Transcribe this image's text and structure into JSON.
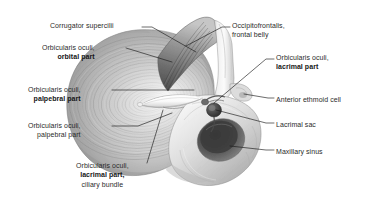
{
  "figure": {
    "kind": "anatomical-illustration",
    "view": "right anterolateral oblique",
    "style": "grayscale halftone medical illustration",
    "background_color": "#ffffff",
    "text_color": "#2b2b2b",
    "leader_color": "#1c1c1c"
  },
  "labels": [
    {
      "id": "corrugator-supercilii",
      "side": "left",
      "align": "right",
      "lines": [
        {
          "text": "Corrugator supercilii",
          "bold": false
        }
      ],
      "x": 36,
      "y": 21,
      "leader": [
        [
          142,
          27
        ],
        [
          152,
          27
        ],
        [
          196,
          52
        ]
      ]
    },
    {
      "id": "orbicularis-oculi-orbital-part",
      "side": "left",
      "align": "right",
      "lines": [
        {
          "text": "Orbicularis oculi,",
          "bold": false
        },
        {
          "text": "orbital part",
          "bold": true
        }
      ],
      "x": 28,
      "y": 43,
      "leader": [
        [
          126,
          48
        ],
        [
          172,
          62
        ]
      ]
    },
    {
      "id": "orbicularis-oculi-palpebral-part-upper",
      "side": "left",
      "align": "right",
      "lines": [
        {
          "text": "Orbicularis oculi,",
          "bold": false
        },
        {
          "text": "palpebral part",
          "bold": true
        }
      ],
      "x": 14,
      "y": 85,
      "leader": [
        [
          112,
          90
        ],
        [
          194,
          90
        ]
      ]
    },
    {
      "id": "orbicularis-oculi-palpebral-part-lower",
      "side": "left",
      "align": "right",
      "lines": [
        {
          "text": "Orbicularis oculi,",
          "bold": false
        },
        {
          "text": "palpebral part",
          "bold": false
        }
      ],
      "x": 14,
      "y": 121,
      "leader": [
        [
          112,
          126
        ],
        [
          138,
          126
        ],
        [
          172,
          113
        ]
      ]
    },
    {
      "id": "orbicularis-oculi-lacrimal-part-ciliary-bundle",
      "side": "bottom",
      "align": "center",
      "lines": [
        {
          "text": "Orbicularis oculi,",
          "bold": false
        },
        {
          "text": "lacrimal part,",
          "bold": true
        },
        {
          "text": "ciliary bundle",
          "bold": false
        }
      ],
      "x": 76,
      "y": 161,
      "leader": [
        [
          147,
          163
        ],
        [
          163,
          110
        ]
      ]
    },
    {
      "id": "occipitofrontalis-frontal-belly",
      "side": "right",
      "align": "left",
      "lines": [
        {
          "text": "Occipitofrontalis,",
          "bold": false
        },
        {
          "text": "frontal belly",
          "bold": false
        }
      ],
      "x": 232,
      "y": 21,
      "leader": [
        [
          230,
          27
        ],
        [
          222,
          27
        ],
        [
          186,
          46
        ]
      ]
    },
    {
      "id": "orbicularis-oculi-lacrimal-part",
      "side": "right",
      "align": "left",
      "lines": [
        {
          "text": "Orbicularis oculi,",
          "bold": false
        },
        {
          "text": "lacrimal part",
          "bold": true
        }
      ],
      "x": 276,
      "y": 53,
      "leader": [
        [
          274,
          59
        ],
        [
          266,
          59
        ],
        [
          214,
          103
        ]
      ]
    },
    {
      "id": "anterior-ethmoid-cell",
      "side": "right",
      "align": "left",
      "lines": [
        {
          "text": "Anterior ethmoid cell",
          "bold": false
        }
      ],
      "x": 276,
      "y": 95,
      "leader": [
        [
          274,
          98
        ],
        [
          268,
          98
        ],
        [
          244,
          94
        ]
      ]
    },
    {
      "id": "lacrimal-sac",
      "side": "right",
      "align": "left",
      "lines": [
        {
          "text": "Lacrimal sac",
          "bold": false
        }
      ],
      "x": 276,
      "y": 120,
      "leader": [
        [
          274,
          123
        ],
        [
          266,
          123
        ],
        [
          216,
          110
        ]
      ]
    },
    {
      "id": "maxillary-sinus",
      "side": "right",
      "align": "left",
      "lines": [
        {
          "text": "Maxillary sinus",
          "bold": false
        }
      ],
      "x": 276,
      "y": 147,
      "leader": [
        [
          274,
          150
        ],
        [
          266,
          150
        ],
        [
          230,
          146
        ]
      ]
    }
  ]
}
